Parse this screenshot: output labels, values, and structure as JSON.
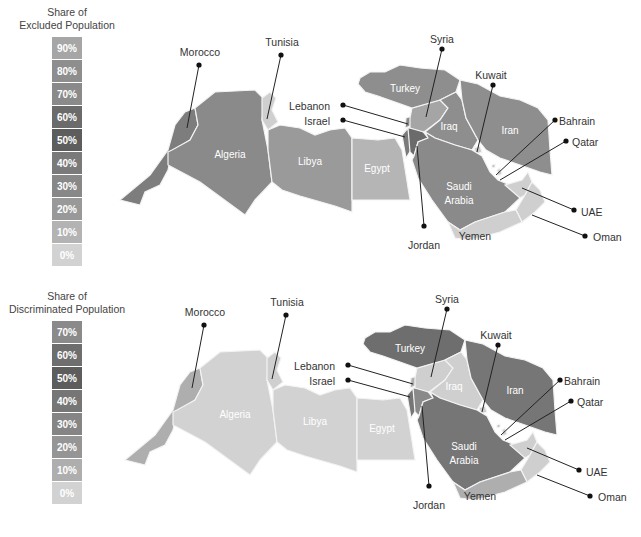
{
  "maps": [
    {
      "id": "excluded",
      "legend": {
        "title_line1": "Share of",
        "title_line2": "Excluded Population",
        "bins": [
          {
            "label": "90%",
            "color": "#a6a6a6"
          },
          {
            "label": "80%",
            "color": "#8e8e8e"
          },
          {
            "label": "70%",
            "color": "#8a8a8a"
          },
          {
            "label": "60%",
            "color": "#6b6b6b"
          },
          {
            "label": "50%",
            "color": "#5d5d5d"
          },
          {
            "label": "40%",
            "color": "#7a7a7a"
          },
          {
            "label": "30%",
            "color": "#888888"
          },
          {
            "label": "20%",
            "color": "#999999"
          },
          {
            "label": "10%",
            "color": "#b3b3b3"
          },
          {
            "label": "0%",
            "color": "#d2d2d2"
          }
        ]
      },
      "countries": {
        "morocco": {
          "label": "Morocco",
          "color": "#7d7d7d"
        },
        "algeria": {
          "label": "Algeria",
          "color": "#8a8a8a"
        },
        "tunisia": {
          "label": "Tunisia",
          "color": "#cfcfcf"
        },
        "libya": {
          "label": "Libya",
          "color": "#9a9a9a"
        },
        "egypt": {
          "label": "Egypt",
          "color": "#b5b5b5"
        },
        "israel": {
          "label": "Israel",
          "color": "#7a7a7a"
        },
        "lebanon": {
          "label": "Lebanon",
          "color": "#8a8a8a"
        },
        "jordan": {
          "label": "Jordan",
          "color": "#6b6b6b"
        },
        "syria": {
          "label": "Syria",
          "color": "#a5a5a5"
        },
        "turkey": {
          "label": "Turkey",
          "color": "#8e8e8e"
        },
        "iraq": {
          "label": "Iraq",
          "color": "#8e8e8e"
        },
        "iran": {
          "label": "Iran",
          "color": "#8e8e8e"
        },
        "kuwait": {
          "label": "Kuwait",
          "color": "#cccccc"
        },
        "saudi": {
          "label": "Saudi Arabia",
          "label_line1": "Saudi",
          "label_line2": "Arabia",
          "color": "#8a8a8a"
        },
        "bahrain": {
          "label": "Bahrain",
          "color": "#bbbbbb"
        },
        "qatar": {
          "label": "Qatar",
          "color": "#cfcfcf"
        },
        "uae": {
          "label": "UAE",
          "color": "#cfcfcf"
        },
        "oman": {
          "label": "Oman",
          "color": "#cfcfcf"
        },
        "yemen": {
          "label": "Yemen",
          "color": "#cfcfcf"
        }
      }
    },
    {
      "id": "discriminated",
      "legend": {
        "title_line1": "Share of",
        "title_line2": "Discriminated Population",
        "bins": [
          {
            "label": "70%",
            "color": "#8a8a8a"
          },
          {
            "label": "60%",
            "color": "#6e6e6e"
          },
          {
            "label": "50%",
            "color": "#5d5d5d"
          },
          {
            "label": "40%",
            "color": "#767676"
          },
          {
            "label": "30%",
            "color": "#858585"
          },
          {
            "label": "20%",
            "color": "#959595"
          },
          {
            "label": "10%",
            "color": "#aeaeae"
          },
          {
            "label": "0%",
            "color": "#d2d2d2"
          }
        ]
      },
      "countries": {
        "morocco": {
          "label": "Morocco",
          "color": "#aeaeae"
        },
        "algeria": {
          "label": "Algeria",
          "color": "#d2d2d2"
        },
        "tunisia": {
          "label": "Tunisia",
          "color": "#cfcfcf"
        },
        "libya": {
          "label": "Libya",
          "color": "#d2d2d2"
        },
        "egypt": {
          "label": "Egypt",
          "color": "#d2d2d2"
        },
        "israel": {
          "label": "Israel",
          "color": "#767676"
        },
        "lebanon": {
          "label": "Lebanon",
          "color": "#aeaeae"
        },
        "jordan": {
          "label": "Jordan",
          "color": "#8a8a8a"
        },
        "syria": {
          "label": "Syria",
          "color": "#cfcfcf"
        },
        "turkey": {
          "label": "Turkey",
          "color": "#6e6e6e"
        },
        "iraq": {
          "label": "Iraq",
          "color": "#cfcfcf"
        },
        "iran": {
          "label": "Iran",
          "color": "#767676"
        },
        "kuwait": {
          "label": "Kuwait",
          "color": "#cccccc"
        },
        "saudi": {
          "label": "Saudi Arabia",
          "label_line1": "Saudi",
          "label_line2": "Arabia",
          "color": "#767676"
        },
        "bahrain": {
          "label": "Bahrain",
          "color": "#bbbbbb"
        },
        "qatar": {
          "label": "Qatar",
          "color": "#cfcfcf"
        },
        "uae": {
          "label": "UAE",
          "color": "#cfcfcf"
        },
        "oman": {
          "label": "Oman",
          "color": "#cfcfcf"
        },
        "yemen": {
          "label": "Yemen",
          "color": "#aeaeae"
        }
      }
    }
  ]
}
